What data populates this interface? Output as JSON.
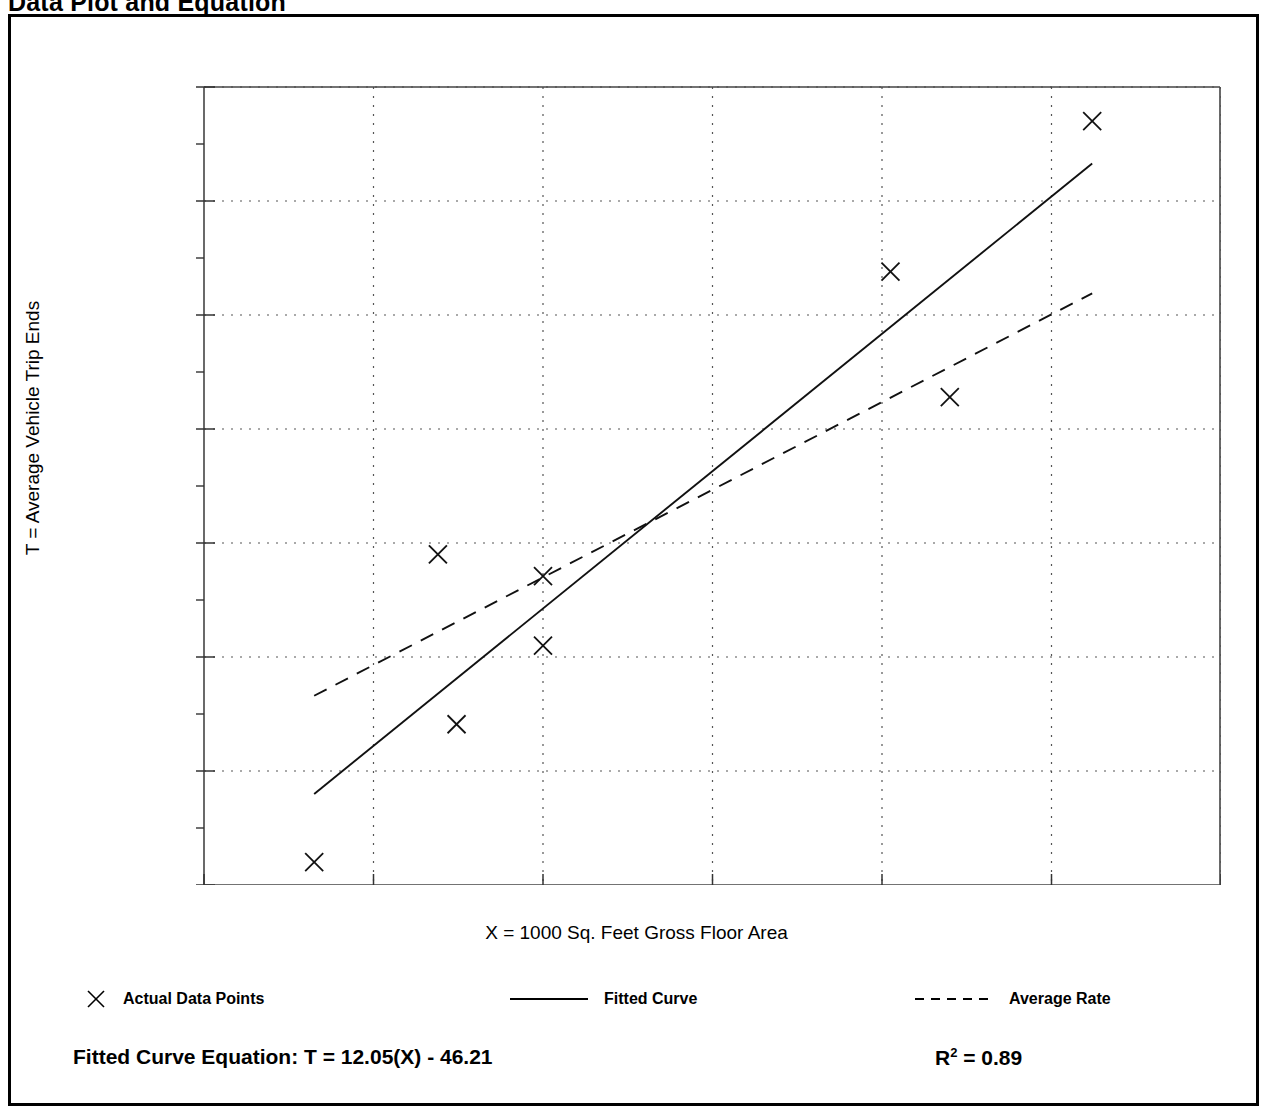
{
  "page": {
    "title": "Data Plot and Equation"
  },
  "chart_data": {
    "type": "scatter",
    "title": "Data Plot and Equation",
    "xlabel": "X = 1000 Sq. Feet Gross Floor Area",
    "ylabel": "T = Average Vehicle Trip Ends",
    "xlim": [
      8,
      14
    ],
    "ylim": [
      50,
      120
    ],
    "xticks": [
      8,
      9,
      10,
      11,
      12,
      13,
      14
    ],
    "yticks": [
      50,
      60,
      70,
      80,
      90,
      100,
      110,
      120
    ],
    "y_minor_ticks": [
      55,
      65,
      75,
      85,
      95,
      105,
      115
    ],
    "grid": true,
    "grid_style": "dotted",
    "legend_position": "below-plot",
    "series": [
      {
        "name": "Actual Data Points",
        "type": "scatter",
        "marker": "x",
        "points": [
          {
            "x": 8.65,
            "y": 52.0
          },
          {
            "x": 9.49,
            "y": 64.1
          },
          {
            "x": 9.38,
            "y": 79.0
          },
          {
            "x": 10.0,
            "y": 77.1
          },
          {
            "x": 10.0,
            "y": 71.0
          },
          {
            "x": 12.05,
            "y": 103.8
          },
          {
            "x": 12.4,
            "y": 92.8
          },
          {
            "x": 13.24,
            "y": 117.0
          }
        ]
      },
      {
        "name": "Fitted Curve",
        "type": "line",
        "style": "solid",
        "endpoints": [
          {
            "x": 8.65,
            "y": 57.99
          },
          {
            "x": 13.24,
            "y": 113.29
          }
        ],
        "equation": "T = 12.05(X) - 46.21",
        "slope": 12.05,
        "intercept": -46.21,
        "r_squared": 0.89
      },
      {
        "name": "Average Rate",
        "type": "line",
        "style": "dashed",
        "endpoints": [
          {
            "x": 8.65,
            "y": 66.6
          },
          {
            "x": 13.24,
            "y": 101.9
          }
        ]
      }
    ]
  },
  "legend": {
    "items": [
      {
        "label": "Actual Data Points",
        "marker": "x-marker"
      },
      {
        "label": "Fitted Curve",
        "marker": "solid-line"
      },
      {
        "label": "Average Rate",
        "marker": "dashed-line"
      }
    ]
  },
  "footer": {
    "equation_label": "Fitted Curve Equation:",
    "equation_value": "T = 12.05(X) - 46.21",
    "equation_full": "Fitted Curve Equation:  T = 12.05(X) - 46.21",
    "r_symbol": "R",
    "r_exponent": "2",
    "r_value": "= 0.89"
  }
}
